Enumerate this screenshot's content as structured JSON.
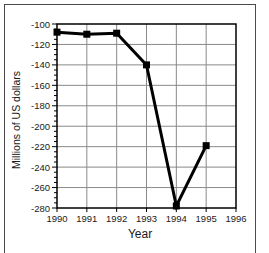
{
  "figure": {
    "background_color": "#ffffff",
    "frame_border_color": "#4a4a4a"
  },
  "chart_data": {
    "type": "line",
    "title": "",
    "xlabel": "Year",
    "ylabel": "Millions of US dollars",
    "x": [
      1990,
      1991,
      1992,
      1993,
      1994,
      1995
    ],
    "values": [
      -108,
      -110,
      -109,
      -140,
      -278,
      -219
    ],
    "xlim": [
      1990,
      1996
    ],
    "ylim": [
      -280,
      -100
    ],
    "xticks": [
      "1990",
      "1991",
      "1992",
      "1993",
      "1994",
      "1995",
      "1996"
    ],
    "yticks": [
      "-100",
      "-120",
      "-140",
      "-160",
      "-180",
      "-200",
      "-220",
      "-240",
      "-260",
      "-280"
    ],
    "y_minor_tick_step": 5,
    "grid": "on",
    "legend": "none",
    "marker": "filled-square",
    "marker_size_px": 7,
    "line_width_px": 3,
    "line_color": "#000000",
    "marker_color": "#000000",
    "grid_color": "#8a8a8a",
    "axis_color": "#000000"
  }
}
